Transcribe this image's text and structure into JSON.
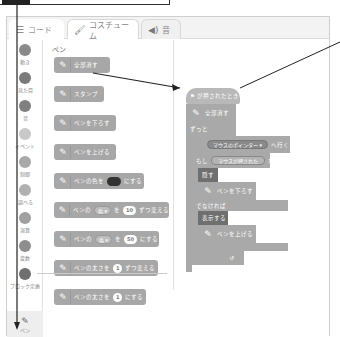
{
  "tabs": [
    {
      "label": "コード",
      "icon": "code-icon",
      "active": true
    },
    {
      "label": "コスチューム",
      "icon": "brush-icon",
      "active": false
    },
    {
      "label": "音",
      "icon": "speaker-icon",
      "active": false
    }
  ],
  "categories": [
    {
      "label": "動き"
    },
    {
      "label": "見た目"
    },
    {
      "label": "音"
    },
    {
      "label": "イベント"
    },
    {
      "label": "制御"
    },
    {
      "label": "調べる"
    },
    {
      "label": "演算"
    },
    {
      "label": "変数"
    },
    {
      "label": "ブロック定義"
    }
  ],
  "extension": {
    "label": "ペン",
    "icon": "pen-icon"
  },
  "palette": {
    "title": "ペン",
    "blocks": [
      {
        "text": "全部消す"
      },
      {
        "text": "スタンプ"
      },
      {
        "text": "ペンを下ろす"
      },
      {
        "text": "ペンを上げる"
      },
      {
        "pre": "ペンの色を",
        "post": "にする",
        "color": "#333333"
      },
      {
        "pre": "ペンの",
        "dropdown": "色 ▾",
        "mid": "を",
        "value": "10",
        "post": "ずつ変える"
      },
      {
        "pre": "ペンの",
        "dropdown": "色 ▾",
        "mid": "を",
        "value": "50",
        "post": "にする"
      },
      {
        "pre": "ペンの太さを",
        "value": "1",
        "post": "ずつ変える"
      },
      {
        "pre": "ペンの太さを",
        "value": "1",
        "post": "にする"
      }
    ]
  },
  "script": {
    "hat": "⚑ が押されたとき",
    "clear": "全部消す",
    "forever": "ずっと",
    "goto_pre": "",
    "goto_target": "マウスのポインター ▾",
    "goto_post": "へ行く",
    "if_pre": "もし",
    "if_cond": "マウスが押された",
    "if_post": "なら",
    "hide": "隠す",
    "pen_down": "ペンを下ろす",
    "else": "でなければ",
    "show": "表示する",
    "pen_up": "ペンを上げる",
    "loop_arrow": "↺"
  }
}
